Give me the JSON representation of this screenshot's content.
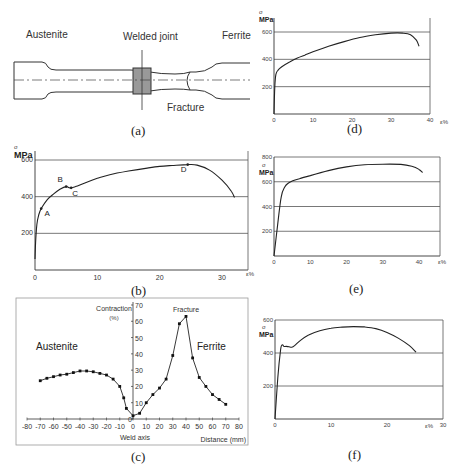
{
  "figure": {
    "panel_a": {
      "caption": "(a)",
      "labels": {
        "left": "Austenite",
        "center": "Welded joint",
        "right": "Ferrite",
        "bottom": "Fracture"
      }
    },
    "panel_b": {
      "caption": "(b)"
    },
    "panel_c": {
      "caption": "(c)"
    },
    "panel_d": {
      "caption": "(d)"
    },
    "panel_e": {
      "caption": "(e)"
    },
    "panel_f": {
      "caption": "(f)"
    }
  },
  "chart_data": [
    {
      "panel": "b",
      "type": "line",
      "title": "",
      "ylabel": "σ MPa",
      "xlabel": "ε%",
      "xticks": [
        0,
        10,
        20,
        30
      ],
      "yticks": [
        200,
        400,
        600
      ],
      "xlim": [
        0,
        34
      ],
      "ylim": [
        0,
        640
      ],
      "grid": "horizontal",
      "annotations": [
        {
          "label": "A",
          "x": 1.0,
          "y": 335
        },
        {
          "label": "B",
          "x": 5.0,
          "y": 455
        },
        {
          "label": "C",
          "x": 5.8,
          "y": 448
        },
        {
          "label": "D",
          "x": 24.5,
          "y": 575
        }
      ],
      "x": [
        0,
        0.1,
        0.3,
        0.6,
        1.0,
        2.0,
        3.0,
        4.0,
        5.0,
        5.6,
        6.5,
        8,
        10,
        12,
        15,
        18,
        20,
        22,
        24.5,
        26,
        28,
        30,
        31.5,
        32
      ],
      "y": [
        60,
        150,
        250,
        300,
        335,
        385,
        415,
        440,
        455,
        448,
        455,
        475,
        500,
        520,
        540,
        556,
        565,
        570,
        575,
        572,
        545,
        490,
        430,
        395
      ]
    },
    {
      "panel": "c",
      "type": "line",
      "title": "",
      "ylabel": "Contraction (%)",
      "xlabel": "Distance (mm)",
      "xticks": [
        -80,
        -70,
        -60,
        -50,
        -40,
        -30,
        -20,
        -10,
        0,
        10,
        20,
        30,
        40,
        50,
        60,
        70,
        80
      ],
      "yticks": [
        0,
        10,
        20,
        30,
        40,
        50,
        60,
        70
      ],
      "xlim": [
        -80,
        80
      ],
      "ylim": [
        0,
        70
      ],
      "annotations": [
        {
          "label": "Fracture",
          "x": 40,
          "y": 68
        },
        {
          "label": "Austenite",
          "x": -62,
          "y": 45
        },
        {
          "label": "Ferrite",
          "x": 55,
          "y": 45
        },
        {
          "label": "Weld axis",
          "x": 0,
          "y": -8
        }
      ],
      "x": [
        -70,
        -65,
        -60,
        -55,
        -50,
        -45,
        -40,
        -35,
        -30,
        -25,
        -20,
        -15,
        -10,
        -7,
        -5,
        0,
        5,
        10,
        15,
        20,
        25,
        30,
        35,
        40,
        45,
        50,
        55,
        60,
        65,
        70
      ],
      "y": [
        23.5,
        25,
        26,
        27,
        27.5,
        28.5,
        29.5,
        29.5,
        29,
        28,
        27,
        24.5,
        20,
        13,
        6.5,
        2,
        3.5,
        10,
        15,
        19,
        24.5,
        39,
        58.5,
        63,
        37.5,
        25.5,
        20,
        15,
        12,
        9
      ]
    },
    {
      "panel": "d",
      "type": "line",
      "ylabel": "σ MPa",
      "xlabel": "ε%",
      "xticks": [
        0,
        10,
        20,
        30,
        40
      ],
      "yticks": [
        200,
        400,
        600
      ],
      "xlim": [
        0,
        40
      ],
      "ylim": [
        0,
        640
      ],
      "grid": "horizontal",
      "x": [
        0,
        0.2,
        0.5,
        1,
        2,
        4,
        6,
        8,
        10,
        14,
        18,
        22,
        26,
        30,
        33,
        35,
        36.5,
        37.2
      ],
      "y": [
        0,
        200,
        290,
        320,
        345,
        380,
        410,
        432,
        455,
        495,
        530,
        560,
        580,
        592,
        592,
        580,
        540,
        495
      ]
    },
    {
      "panel": "e",
      "type": "line",
      "ylabel": "σ MPa",
      "xlabel": "ε%",
      "xticks": [
        0,
        10,
        20,
        30,
        40
      ],
      "yticks": [
        200,
        400,
        600,
        800
      ],
      "xlim": [
        0,
        45
      ],
      "ylim": [
        0,
        800
      ],
      "grid": "horizontal",
      "x": [
        0,
        1,
        2,
        3,
        4,
        5,
        7,
        10,
        15,
        20,
        25,
        30,
        35,
        38,
        40,
        41
      ],
      "y": [
        0,
        250,
        480,
        560,
        590,
        605,
        625,
        650,
        690,
        720,
        738,
        742,
        740,
        725,
        700,
        675
      ]
    },
    {
      "panel": "f",
      "type": "line",
      "ylabel": "σ MPa",
      "xlabel": "ε%",
      "xticks": [
        0,
        10,
        20,
        30
      ],
      "yticks": [
        200,
        400,
        600
      ],
      "xlim": [
        0,
        30
      ],
      "ylim": [
        0,
        620
      ],
      "grid": "horizontal",
      "x": [
        0,
        0.5,
        1.0,
        1.3,
        1.6,
        2.0,
        2.5,
        3.0,
        3.5,
        4.5,
        6,
        8,
        10,
        12,
        14,
        16,
        18,
        20,
        22,
        24,
        25.2
      ],
      "y": [
        0,
        250,
        420,
        450,
        440,
        440,
        438,
        435,
        445,
        475,
        510,
        535,
        550,
        557,
        560,
        558,
        548,
        525,
        490,
        445,
        405
      ]
    }
  ],
  "axis_labels": {
    "sigma": "σ",
    "mpa": "MPa",
    "eps": "ε%",
    "contraction": "Contraction",
    "contraction_unit": "(%)",
    "weld_axis": "Weld axis",
    "distance": "Distance (mm)",
    "fracture": "Fracture",
    "austenite": "Austenite",
    "ferrite": "Ferrite"
  }
}
